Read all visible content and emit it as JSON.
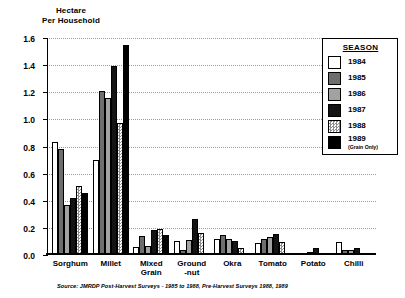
{
  "axis_title_line1": "Hectare",
  "axis_title_line2": "Per Household",
  "legend": {
    "title": "SEASON",
    "items": [
      {
        "label": "1984",
        "sub": "",
        "color": "#ffffff"
      },
      {
        "label": "1985",
        "sub": "",
        "color": "#6e6e6e"
      },
      {
        "label": "1986",
        "sub": "",
        "color": "#a2a2a2"
      },
      {
        "label": "1987",
        "sub": "",
        "color": "#141414"
      },
      {
        "label": "1988",
        "sub": "",
        "color": "#c9c9c9"
      },
      {
        "label": "1989",
        "sub": "(Grain Only)",
        "color": "#000000"
      }
    ]
  },
  "footnote": "Source: JMRDP Post-Harvest Surveys - 1985 to 1988, Pre-Harvest Surveys 1988, 1989",
  "chart_data": {
    "type": "bar",
    "title": "",
    "xlabel": "",
    "ylabel": "Hectare Per Household",
    "ylim": [
      0,
      1.6
    ],
    "yticks": [
      "0.0",
      "0.2",
      "0.4",
      "0.6",
      "0.8",
      "1.0",
      "1.2",
      "1.4",
      "1.6"
    ],
    "ytick_values": [
      0,
      0.2,
      0.4,
      0.6,
      0.8,
      1.0,
      1.2,
      1.4,
      1.6
    ],
    "grid": true,
    "legend_position": "top-right",
    "categories": [
      "Sorghum",
      "Millet",
      "Mixed\nGrain",
      "Ground\n-nut",
      "Okra",
      "Tomato",
      "Potato",
      "Chilli"
    ],
    "series": [
      {
        "name": "1984",
        "values": [
          0.83,
          0.7,
          0.06,
          0.1,
          0.12,
          0.09,
          0.005,
          0.095
        ]
      },
      {
        "name": "1985",
        "values": [
          0.78,
          1.21,
          0.14,
          0.04,
          0.15,
          0.12,
          0.015,
          0.04
        ]
      },
      {
        "name": "1986",
        "values": [
          0.37,
          1.16,
          0.07,
          0.11,
          0.12,
          0.13,
          0.025,
          0.035
        ]
      },
      {
        "name": "1987",
        "values": [
          0.42,
          1.39,
          0.185,
          0.265,
          0.1,
          0.155,
          0.055,
          0.055
        ]
      },
      {
        "name": "1988",
        "values": [
          0.51,
          0.97,
          0.195,
          0.165,
          0.055,
          0.095,
          0.01,
          0.015
        ]
      },
      {
        "name": "1989 (Grain Only)",
        "values": [
          0.46,
          1.55,
          0.145,
          0.0,
          0.0,
          0.0,
          0.0,
          0.0
        ]
      }
    ]
  }
}
